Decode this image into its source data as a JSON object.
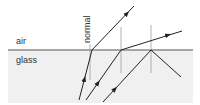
{
  "diagram": {
    "medium_top_label": "air",
    "medium_bottom_label": "glass",
    "normal_label": "normal",
    "colors": {
      "glass_fill": "#f0f0f0",
      "interface_line": "#8a8a8a",
      "normal_line": "#a0a0a0",
      "ray": "#222222",
      "text": "#333333"
    },
    "rays": [
      {
        "name": "ray-1",
        "behavior": "refracted"
      },
      {
        "name": "ray-2",
        "behavior": "refracted-grazing"
      },
      {
        "name": "ray-3",
        "behavior": "total-internal-reflection"
      }
    ]
  }
}
